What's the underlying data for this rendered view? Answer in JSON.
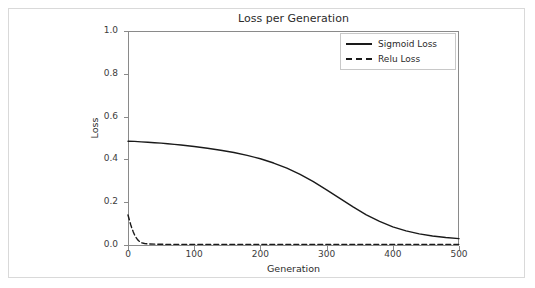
{
  "chart_data": {
    "type": "line",
    "title": "Loss per Generation",
    "xlabel": "Generation",
    "ylabel": "Loss",
    "xlim": [
      0,
      500
    ],
    "ylim": [
      0.0,
      1.0
    ],
    "xticks": [
      0,
      100,
      200,
      300,
      400,
      500
    ],
    "xtick_labels": [
      "0",
      "100",
      "200",
      "300",
      "400",
      "500"
    ],
    "yticks": [
      0.0,
      0.2,
      0.4,
      0.6,
      0.8,
      1.0
    ],
    "ytick_labels": [
      "0.0",
      "0.2",
      "0.4",
      "0.6",
      "0.8",
      "1.0"
    ],
    "grid": false,
    "legend_position": "upper right",
    "series": [
      {
        "name": "Sigmoid Loss",
        "style": "solid",
        "color": "#1a1a1a",
        "x": [
          0,
          10,
          20,
          30,
          40,
          50,
          60,
          70,
          80,
          90,
          100,
          120,
          140,
          160,
          180,
          200,
          220,
          240,
          260,
          280,
          300,
          320,
          340,
          360,
          380,
          400,
          420,
          440,
          460,
          480,
          500
        ],
        "y": [
          0.485,
          0.484,
          0.482,
          0.48,
          0.478,
          0.476,
          0.473,
          0.47,
          0.467,
          0.464,
          0.46,
          0.452,
          0.443,
          0.432,
          0.419,
          0.403,
          0.383,
          0.359,
          0.33,
          0.296,
          0.258,
          0.218,
          0.178,
          0.141,
          0.11,
          0.085,
          0.066,
          0.052,
          0.042,
          0.035,
          0.03
        ]
      },
      {
        "name": "Relu Loss",
        "style": "dashed",
        "color": "#1a1a1a",
        "x": [
          0,
          2,
          4,
          6,
          8,
          10,
          12,
          14,
          16,
          18,
          20,
          25,
          30,
          40,
          60,
          100,
          150,
          200,
          250,
          300,
          350,
          400,
          450,
          500
        ],
        "y": [
          0.14,
          0.118,
          0.096,
          0.077,
          0.061,
          0.047,
          0.036,
          0.027,
          0.02,
          0.015,
          0.011,
          0.007,
          0.005,
          0.004,
          0.003,
          0.003,
          0.003,
          0.003,
          0.003,
          0.003,
          0.003,
          0.003,
          0.003,
          0.003
        ]
      }
    ]
  },
  "figure": {
    "background": "#ffffff",
    "border_color": "#d9d9d9",
    "axis_color": "#8a8a8a",
    "text_color": "#2b2b2b"
  }
}
